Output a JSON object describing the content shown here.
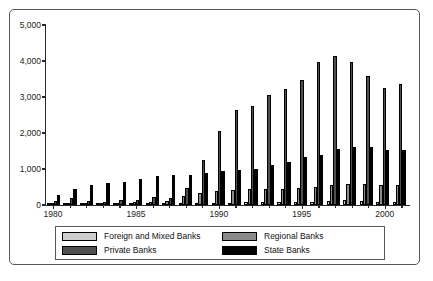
{
  "chart_data": {
    "type": "bar",
    "title": "",
    "subtitle": "",
    "xlabel": "",
    "ylabel": "",
    "ylim": [
      0,
      5000
    ],
    "yticks": [
      0,
      1000,
      2000,
      3000,
      4000,
      5000
    ],
    "ytick_labels": [
      "0",
      "1,000",
      "2,000",
      "3,000",
      "4,000",
      "5,000"
    ],
    "xtick_labels": [
      "1980",
      "1985",
      "1990",
      "1995",
      "2000"
    ],
    "grid": false,
    "legend_position": "bottom",
    "categories": [
      "1980",
      "1981",
      "1982",
      "1983",
      "1984",
      "1985",
      "1986",
      "1987",
      "1988",
      "1989",
      "1990",
      "1991",
      "1992",
      "1993",
      "1994",
      "1995",
      "1996",
      "1997",
      "1998",
      "1999",
      "2000",
      "2001"
    ],
    "series": [
      {
        "name": "Foreign and Mixed Banks",
        "color": "#cdcdcd",
        "values": [
          10,
          12,
          14,
          16,
          18,
          22,
          26,
          30,
          35,
          45,
          55,
          60,
          70,
          80,
          85,
          90,
          95,
          105,
          130,
          110,
          95,
          90
        ]
      },
      {
        "name": "Regional Banks",
        "color": "#8a8a8a",
        "values": [
          20,
          35,
          45,
          50,
          60,
          80,
          95,
          110,
          240,
          330,
          380,
          420,
          450,
          440,
          440,
          460,
          510,
          560,
          570,
          570,
          560,
          560
        ]
      },
      {
        "name": "Private Banks",
        "color": "#4f4f4f",
        "values": [
          120,
          200,
          115,
          95,
          130,
          150,
          210,
          195,
          470,
          1250,
          2060,
          2630,
          2760,
          3060,
          3220,
          3470,
          3970,
          4150,
          3980,
          3590,
          3240,
          3350
        ]
      },
      {
        "name": "State Banks",
        "color": "#000000",
        "values": [
          280,
          440,
          555,
          615,
          650,
          730,
          800,
          830,
          840,
          900,
          955,
          975,
          1005,
          1100,
          1190,
          1320,
          1390,
          1550,
          1620,
          1600,
          1520,
          1530
        ]
      }
    ]
  },
  "legend": {
    "entries": [
      {
        "label": "Foreign and Mixed Banks",
        "color": "#cdcdcd"
      },
      {
        "label": "Regional Banks",
        "color": "#8a8a8a"
      },
      {
        "label": "Private Banks",
        "color": "#4f4f4f"
      },
      {
        "label": "State Banks",
        "color": "#000000"
      }
    ]
  }
}
